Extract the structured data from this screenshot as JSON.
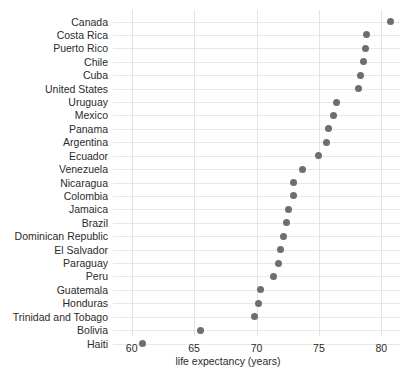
{
  "chart_data": {
    "type": "scatter",
    "title": "",
    "xlabel": "life expectancy (years)",
    "ylabel": "",
    "xlim": [
      58.5,
      81.5
    ],
    "xticks": [
      60,
      65,
      70,
      75,
      80
    ],
    "xtick_labels": [
      "60",
      "65",
      "70",
      "75",
      "80"
    ],
    "grid": true,
    "legend": "none",
    "orientation": "horizontal-dot-plot",
    "marker": {
      "shape": "circle",
      "color": "#6e6e6e",
      "size": 7
    },
    "categories": [
      "Canada",
      "Costa Rica",
      "Puerto Rico",
      "Chile",
      "Cuba",
      "United States",
      "Uruguay",
      "Mexico",
      "Panama",
      "Argentina",
      "Ecuador",
      "Venezuela",
      "Nicaragua",
      "Colombia",
      "Jamaica",
      "Brazil",
      "Dominican Republic",
      "El Salvador",
      "Paraguay",
      "Peru",
      "Guatemala",
      "Honduras",
      "Trinidad and Tobago",
      "Bolivia",
      "Haiti"
    ],
    "values": [
      80.7,
      78.8,
      78.7,
      78.6,
      78.3,
      78.2,
      76.4,
      76.2,
      75.8,
      75.6,
      75.0,
      73.7,
      73.0,
      73.0,
      72.6,
      72.4,
      72.2,
      71.9,
      71.8,
      71.4,
      70.3,
      70.2,
      69.8,
      65.5,
      60.9
    ],
    "series_name": "life expectancy"
  },
  "axis": {
    "x_title": "life expectancy (years)"
  }
}
